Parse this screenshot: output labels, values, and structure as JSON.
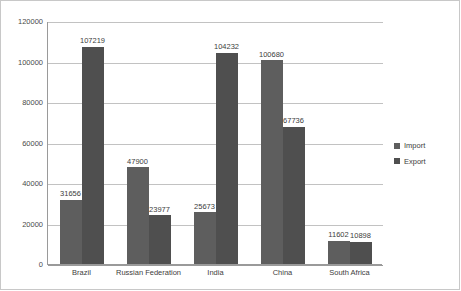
{
  "chart_data": {
    "type": "bar",
    "title": "",
    "xlabel": "",
    "ylabel": "",
    "ylim": [
      0,
      120000
    ],
    "yticks": [
      0,
      20000,
      40000,
      60000,
      80000,
      100000,
      120000
    ],
    "ytick_labels": [
      "0",
      "20000",
      "40000",
      "60000",
      "80000",
      "100000",
      "120000"
    ],
    "grid": true,
    "legend_position": "right",
    "categories": [
      "Brazil",
      "Russian Federation",
      "India",
      "China",
      "South Africa"
    ],
    "series": [
      {
        "name": "Import",
        "color": "#5e5e5e",
        "values": [
          31656,
          47900,
          25673,
          100680,
          11602
        ]
      },
      {
        "name": "Export",
        "color": "#4f4f4f",
        "values": [
          107219,
          23977,
          104232,
          67736,
          10898
        ]
      }
    ],
    "data_labels": {
      "Brazil": {
        "Import": "31656",
        "Export": "107219"
      },
      "Russian Federation": {
        "Import": "47900",
        "Export": "23977"
      },
      "India": {
        "Import": "25673",
        "Export": "104232"
      },
      "China": {
        "Import": "100680",
        "Export": "67736"
      },
      "South Africa": {
        "Import": "11602",
        "Export": "10898"
      }
    }
  },
  "legend": {
    "items": [
      {
        "label": "Import"
      },
      {
        "label": "Export"
      }
    ]
  }
}
